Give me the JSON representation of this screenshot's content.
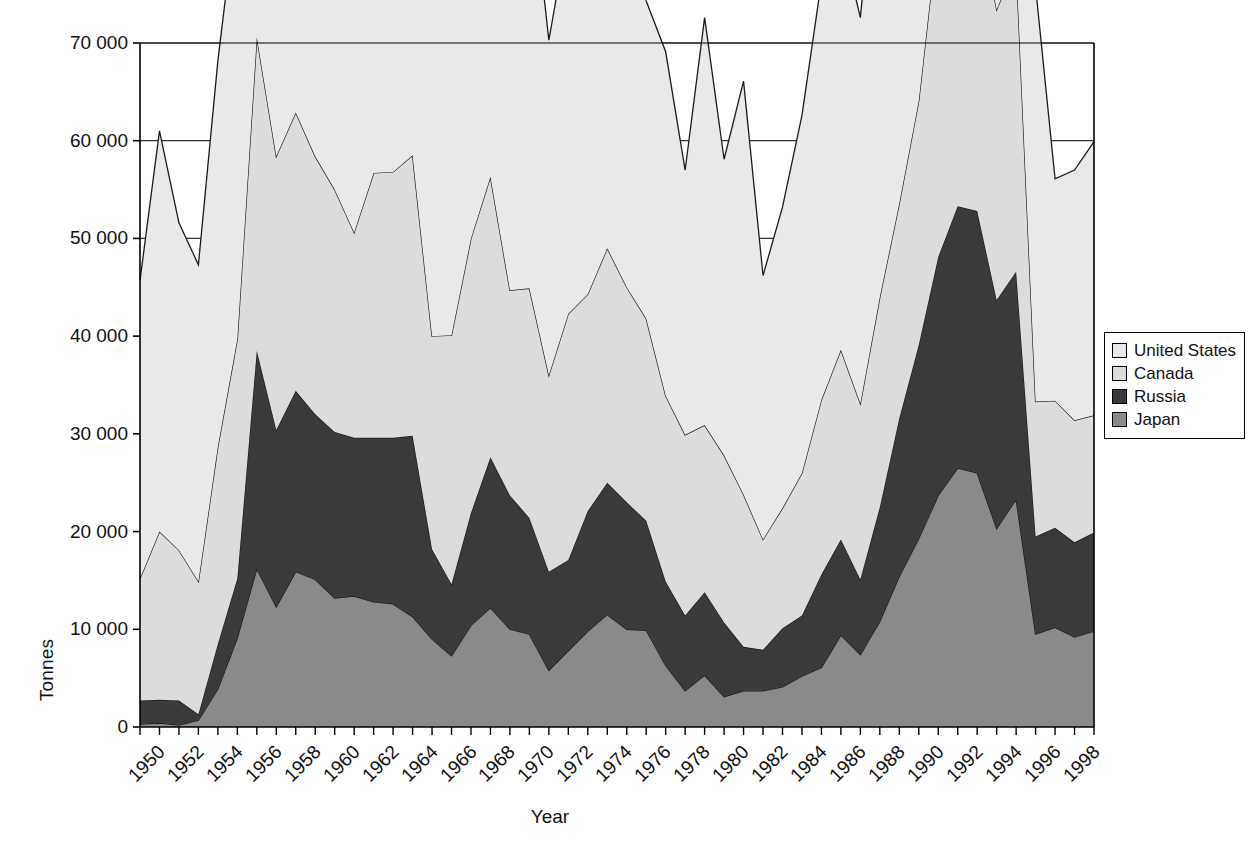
{
  "chart_data": {
    "type": "area",
    "stacked": true,
    "title": "",
    "xlabel": "Year",
    "ylabel": "Tonnes",
    "xlim": [
      1950,
      1999
    ],
    "ylim": [
      0,
      70000
    ],
    "ytick_labels": [
      "0",
      "10 000",
      "20 000",
      "30 000",
      "40 000",
      "50 000",
      "60 000",
      "70 000"
    ],
    "ytick_values": [
      0,
      10000,
      20000,
      30000,
      40000,
      50000,
      60000,
      70000
    ],
    "xtick_labels": [
      "1950",
      "1952",
      "1954",
      "1956",
      "1958",
      "1960",
      "1962",
      "1964",
      "1966",
      "1968",
      "1970",
      "1972",
      "1974",
      "1976",
      "1978",
      "1980",
      "1982",
      "1984",
      "1986",
      "1988",
      "1990",
      "1992",
      "1994",
      "1996",
      "1998"
    ],
    "xtick_values": [
      1950,
      1952,
      1954,
      1956,
      1958,
      1960,
      1962,
      1964,
      1966,
      1968,
      1970,
      1972,
      1974,
      1976,
      1978,
      1980,
      1982,
      1984,
      1986,
      1988,
      1990,
      1992,
      1994,
      1996,
      1998
    ],
    "grid": "horizontal",
    "legend_position": "right",
    "x": [
      1950,
      1951,
      1952,
      1953,
      1954,
      1955,
      1956,
      1957,
      1958,
      1959,
      1960,
      1961,
      1962,
      1963,
      1964,
      1965,
      1966,
      1967,
      1968,
      1969,
      1970,
      1971,
      1972,
      1973,
      1974,
      1975,
      1976,
      1977,
      1978,
      1979,
      1980,
      1981,
      1982,
      1983,
      1984,
      1985,
      1986,
      1987,
      1988,
      1989,
      1990,
      1991,
      1992,
      1993,
      1994,
      1995,
      1996,
      1997,
      1998,
      1999
    ],
    "series": [
      {
        "name": "Japan",
        "color": "#8a8a8a",
        "stack_order": 1,
        "values": [
          300,
          400,
          200,
          700,
          3900,
          9100,
          16200,
          12300,
          15900,
          15100,
          13200,
          13400,
          12800,
          12600,
          11300,
          9000,
          7300,
          10400,
          12200,
          10000,
          9500,
          5800,
          7800,
          9800,
          11500,
          10000,
          9900,
          6300,
          3700,
          5300,
          3100,
          3700,
          3700,
          4100,
          5200,
          6100,
          9400,
          7400,
          10800,
          15400,
          19300,
          23700,
          26500,
          26000,
          20300,
          23300,
          9500,
          10200,
          9200,
          9800
        ]
      },
      {
        "name": "Russia",
        "color": "#3a3a3a",
        "stack_order": 2,
        "values": [
          2400,
          2400,
          2500,
          600,
          4600,
          6100,
          22300,
          18100,
          18500,
          16900,
          17000,
          16200,
          16800,
          17000,
          18500,
          9200,
          7300,
          11500,
          15400,
          13700,
          11900,
          10100,
          9300,
          12300,
          13500,
          13000,
          11200,
          8600,
          7700,
          8500,
          7600,
          4500,
          4200,
          6000,
          6200,
          9500,
          9800,
          7700,
          11700,
          16200,
          19800,
          24400,
          26800,
          26800,
          23400,
          23300,
          10000,
          10200,
          9700,
          10100
        ]
      },
      {
        "name": "Canada",
        "color": "#dcdcdc",
        "stack_order": 3,
        "values": [
          12500,
          17200,
          15400,
          13600,
          20200,
          24500,
          32100,
          28000,
          28500,
          26400,
          24800,
          21000,
          27100,
          27200,
          28700,
          21800,
          25500,
          28100,
          28700,
          21000,
          23500,
          20100,
          25200,
          22200,
          24000,
          22000,
          20700,
          19000,
          18500,
          17100,
          17100,
          15600,
          11300,
          12300,
          14600,
          17900,
          19400,
          18000,
          21500,
          22000,
          25000,
          33700,
          37100,
          31300,
          29700,
          31700,
          13800,
          13000,
          12500,
          12000
        ]
      },
      {
        "name": "United States",
        "color": "#e9e9e9",
        "stack_order": 4,
        "values": [
          30500,
          41000,
          33500,
          32400,
          39500,
          44900,
          45000,
          39700,
          39400,
          30000,
          26800,
          37400,
          27200,
          28800,
          41600,
          38800,
          47000,
          42700,
          45800,
          31000,
          43400,
          34300,
          39300,
          43000,
          32000,
          36100,
          32500,
          35200,
          27100,
          41700,
          30300,
          42300,
          27000,
          30800,
          36600,
          42800,
          42400,
          39500,
          49400,
          53200,
          58700,
          59400,
          57100,
          64300,
          45400,
          64400,
          42400,
          22700,
          25600,
          28000
        ]
      }
    ]
  },
  "legend": {
    "items": [
      {
        "label": "United States",
        "color": "#e9e9e9",
        "icon": "legend-swatch-icon"
      },
      {
        "label": "Canada",
        "color": "#dcdcdc",
        "icon": "legend-swatch-icon"
      },
      {
        "label": "Russia",
        "color": "#3a3a3a",
        "icon": "legend-swatch-icon"
      },
      {
        "label": "Japan",
        "color": "#8a8a8a",
        "icon": "legend-swatch-icon"
      }
    ]
  },
  "axes": {
    "y_title": "Tonnes",
    "x_title": "Year"
  }
}
